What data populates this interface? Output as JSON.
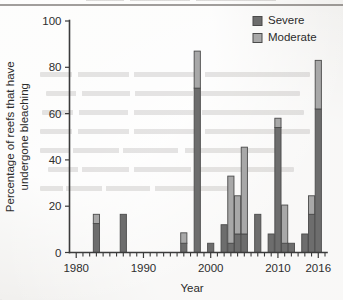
{
  "chart_data": {
    "type": "bar",
    "stacked": true,
    "title": "",
    "xlabel": "Year",
    "ylabel": "Percentage of reefs that have undergone bleaching",
    "xlim": [
      1979,
      2017
    ],
    "ylim": [
      0,
      100
    ],
    "yticks": [
      0,
      20,
      40,
      60,
      80,
      100
    ],
    "xticks": [
      1980,
      1990,
      2000,
      2010,
      2016
    ],
    "xtick_labels": [
      "1980",
      "1990",
      "2000",
      "2010",
      "2016"
    ],
    "xtick_minor_step": 1,
    "grid": false,
    "legend_position": "top-right",
    "categories": [
      1980,
      1981,
      1982,
      1983,
      1984,
      1985,
      1986,
      1987,
      1988,
      1989,
      1990,
      1991,
      1992,
      1993,
      1994,
      1995,
      1996,
      1997,
      1998,
      1999,
      2000,
      2001,
      2002,
      2003,
      2004,
      2005,
      2006,
      2007,
      2008,
      2009,
      2010,
      2011,
      2012,
      2013,
      2014,
      2015,
      2016
    ],
    "series": [
      {
        "name": "Severe",
        "color": "#6d6d6d",
        "values": [
          0,
          0,
          0,
          12.5,
          0,
          0,
          0,
          16.5,
          0,
          0,
          0,
          0,
          0,
          0,
          0,
          0,
          4,
          0,
          71,
          0,
          4,
          0,
          12,
          4,
          8,
          8,
          0,
          16.5,
          0,
          8,
          54,
          4,
          4,
          0,
          8,
          16.5,
          62
        ]
      },
      {
        "name": "Moderate",
        "color": "#a8a8a8",
        "values": [
          0,
          0,
          0,
          4,
          0,
          0,
          0,
          0,
          0,
          0,
          0,
          0,
          0,
          0,
          0,
          0,
          4.5,
          0,
          16,
          0,
          0,
          0,
          0,
          29,
          16.5,
          37.5,
          0,
          0,
          0,
          0,
          4,
          16.5,
          0,
          0,
          0,
          8,
          21
        ]
      }
    ],
    "totals": [
      0,
      0,
      0,
      16.5,
      0,
      0,
      0,
      16.5,
      0,
      0,
      0,
      0,
      0,
      0,
      0,
      0,
      8.5,
      0,
      87,
      0,
      4,
      0,
      12,
      33,
      24.5,
      45.5,
      0,
      16.5,
      0,
      8,
      58,
      20.5,
      4,
      0,
      8,
      24.5,
      83
    ]
  },
  "legend": {
    "items": [
      {
        "label": "Severe",
        "color": "#6d6d6d"
      },
      {
        "label": "Moderate",
        "color": "#a8a8a8"
      }
    ]
  },
  "axes": {
    "y_title": "Percentage of reefs that have undergone bleaching",
    "x_title": "Year",
    "y_labels": [
      "100",
      "80",
      "60",
      "40",
      "20",
      "0"
    ],
    "x_labels": [
      "1980",
      "1990",
      "2000",
      "2010",
      "2016"
    ]
  },
  "colors": {
    "severe": "#6d6d6d",
    "moderate": "#a8a8a8",
    "axis": "#3b3b3b",
    "text": "#2b2b2b",
    "background": "#f1f0ee",
    "bar_outline": "#4a4a4a"
  }
}
